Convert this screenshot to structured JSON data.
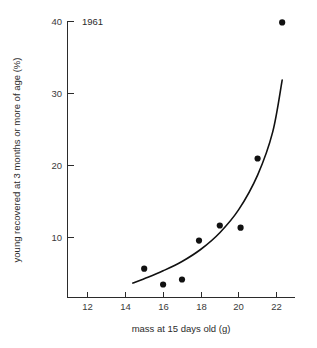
{
  "chart_data": {
    "type": "scatter",
    "title": "",
    "annotation": "1961",
    "xlabel": "mass at 15 days old (g)",
    "ylabel": "young recovered at 3 months or more of age (%)",
    "xlim": [
      11.0,
      23.0
    ],
    "ylim": [
      2.0,
      40.0
    ],
    "xticks": [
      12,
      14,
      16,
      18,
      20,
      22
    ],
    "xtick_labels": [
      "12",
      "14",
      "16",
      "18",
      "20",
      "22"
    ],
    "yticks": [
      10,
      20,
      30,
      40
    ],
    "ytick_labels": [
      "10",
      "20",
      "30",
      "40"
    ],
    "grid": false,
    "legend": false,
    "points": [
      {
        "x": 15.0,
        "y": 5.6
      },
      {
        "x": 16.0,
        "y": 3.4
      },
      {
        "x": 17.0,
        "y": 4.1
      },
      {
        "x": 17.9,
        "y": 9.5
      },
      {
        "x": 19.0,
        "y": 11.6
      },
      {
        "x": 20.1,
        "y": 11.3
      },
      {
        "x": 21.0,
        "y": 20.9
      },
      {
        "x": 22.3,
        "y": 39.8
      }
    ],
    "fit_curve": {
      "name": "fitted exponential trend",
      "x": [
        14.4,
        15.2,
        16.0,
        17.0,
        18.0,
        19.0,
        20.0,
        21.0,
        21.8,
        22.3
      ],
      "y": [
        3.6,
        4.4,
        5.3,
        6.6,
        8.3,
        10.6,
        13.8,
        18.6,
        24.6,
        31.8
      ]
    },
    "colors": {
      "point": "#111111",
      "curve": "#111111",
      "axis": "#2b2b2b",
      "text": "#2b2b2b",
      "background": "#ffffff"
    }
  }
}
